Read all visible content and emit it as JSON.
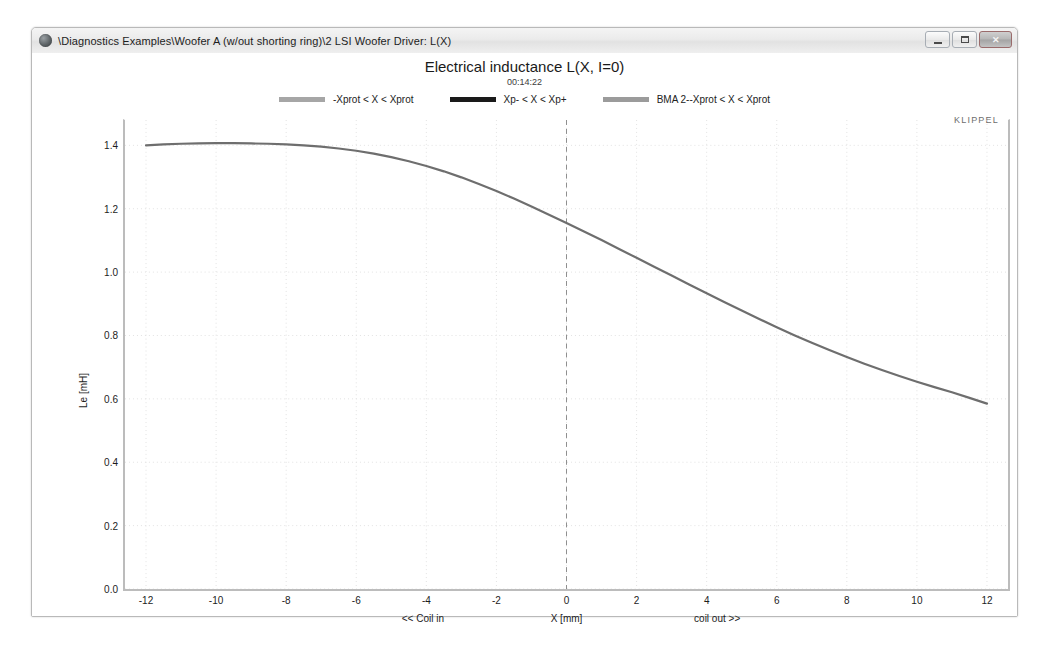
{
  "window": {
    "title": "\\Diagnostics Examples\\Woofer A (w/out shorting ring)\\2 LSI Woofer Driver: L(X)",
    "app_icon": "klippel-app-icon",
    "buttons": {
      "minimize": "minimize",
      "maximize": "maximize",
      "close": "✕"
    }
  },
  "watermark": "KLIPPEL",
  "page_caption": "",
  "chart_data": {
    "type": "line",
    "title": "Electrical inductance L(X, I=0)",
    "subtitle": "00:14:22",
    "xlabel": "X [mm]",
    "ylabel": "Le [mH]",
    "xlabel_left": "<< Coil in",
    "xlabel_right": "coil out >>",
    "xlim": [
      -12.6,
      12.6
    ],
    "ylim": [
      0.0,
      1.48
    ],
    "xticks": [
      -12,
      -10,
      -8,
      -6,
      -4,
      -2,
      0,
      2,
      4,
      6,
      8,
      10,
      12
    ],
    "yticks": [
      0.0,
      0.2,
      0.4,
      0.6,
      0.8,
      1.0,
      1.2,
      1.4
    ],
    "ytick_labels": [
      "0.0",
      "0.2",
      "0.4",
      "0.6",
      "0.8",
      "1.0",
      "1.2",
      "1.4"
    ],
    "xtick_labels": [
      "-12",
      "-10",
      "-8",
      "-6",
      "-4",
      "-2",
      "0",
      "2",
      "4",
      "6",
      "8",
      "10",
      "12"
    ],
    "grid": true,
    "grid_color": "#e2e2e2",
    "marker_line_x": 0,
    "legend_position": "top-center",
    "legend": [
      {
        "label": "-Xprot < X < Xprot",
        "color": "#a6a6a6"
      },
      {
        "label": "Xp- < X < Xp+",
        "color": "#1a1a1a"
      },
      {
        "label": "BMA 2--Xprot < X < Xprot",
        "color": "#9b9b9b"
      }
    ],
    "series": [
      {
        "name": "-Xprot < X < Xprot",
        "color": "#6e6e6e",
        "x": [
          -12.0,
          -11.5,
          -11.0,
          -10.5,
          -10.0,
          -9.5,
          -9.0,
          -8.5,
          -8.0,
          -7.5,
          -7.0,
          -6.5,
          -6.0,
          -5.5,
          -5.0,
          -4.5,
          -4.0,
          -3.5,
          -3.0,
          -2.5,
          -2.0,
          -1.5,
          -1.0,
          -0.5,
          0.0,
          0.5,
          1.0,
          1.5,
          2.0,
          2.5,
          3.0,
          3.5,
          4.0,
          4.5,
          5.0,
          5.5,
          6.0,
          6.5,
          7.0,
          7.5,
          8.0,
          8.5,
          9.0,
          9.5,
          10.0,
          10.5,
          11.0,
          11.5,
          12.0
        ],
        "y": [
          1.4,
          1.403,
          1.405,
          1.406,
          1.407,
          1.407,
          1.406,
          1.405,
          1.403,
          1.4,
          1.396,
          1.39,
          1.383,
          1.374,
          1.363,
          1.35,
          1.335,
          1.318,
          1.299,
          1.278,
          1.256,
          1.232,
          1.207,
          1.181,
          1.155,
          1.128,
          1.101,
          1.073,
          1.045,
          1.017,
          0.989,
          0.961,
          0.933,
          0.906,
          0.879,
          0.852,
          0.826,
          0.801,
          0.777,
          0.754,
          0.732,
          0.711,
          0.691,
          0.672,
          0.654,
          0.637,
          0.621,
          0.603,
          0.585
        ]
      }
    ]
  }
}
